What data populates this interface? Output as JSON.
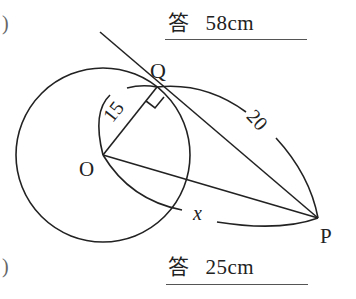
{
  "answers": [
    {
      "kanji": "答",
      "value": "58cm"
    },
    {
      "kanji": "答",
      "value": "25cm"
    }
  ],
  "parens": [
    ")",
    ")"
  ],
  "figure": {
    "labels": {
      "Q": "Q",
      "O": "O",
      "P": "P",
      "x": "x",
      "r": "15",
      "t": "20"
    }
  }
}
